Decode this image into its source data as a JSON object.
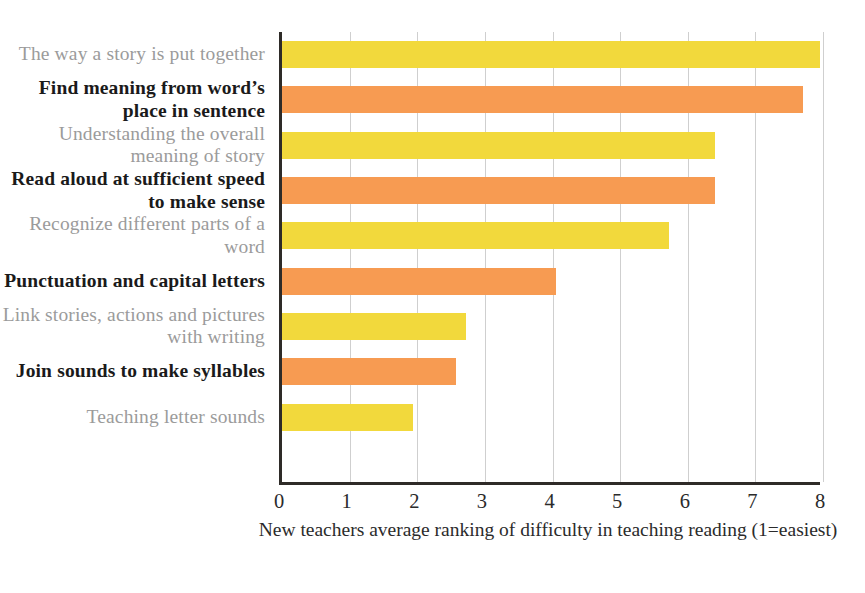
{
  "chart_data": {
    "type": "bar",
    "orientation": "horizontal",
    "title": "",
    "xlabel": "New teachers average ranking of difficulty in teaching reading (1=easiest)",
    "ylabel": "",
    "xlim": [
      0,
      8
    ],
    "xticks": [
      "0",
      "1",
      "2",
      "3",
      "4",
      "5",
      "6",
      "7",
      "8"
    ],
    "grid": "vertical",
    "legend": "none",
    "categories": [
      "The way a story is put together",
      "Find meaning from word’s place in sentence",
      "Understanding the overall meaning of story",
      "Read aloud at sufficient speed to make sense",
      "Recognize different parts of a word",
      "Punctuation and capital letters",
      "Link stories, actions and pictures with writing",
      "Join sounds to make syllables",
      "Teaching letter sounds"
    ],
    "values": [
      8.05,
      7.7,
      6.4,
      6.4,
      5.73,
      4.05,
      2.72,
      2.57,
      1.93
    ],
    "bar_colors": [
      "#F2D93C",
      "#F79B52",
      "#F2D93C",
      "#F79B52",
      "#F2D93C",
      "#F79B52",
      "#F2D93C",
      "#F79B52",
      "#F2D93C"
    ],
    "label_styles": [
      "muted",
      "strong",
      "muted",
      "strong",
      "muted",
      "strong",
      "muted",
      "strong",
      "muted"
    ],
    "colors": {
      "yellow": "#F2D93C",
      "orange": "#F79B52",
      "axis": "#2e2b28",
      "gridline": "#cfcfcf",
      "label_muted": "#9b9b9b",
      "label_strong": "#1a1a1a",
      "background": "#ffffff"
    }
  }
}
